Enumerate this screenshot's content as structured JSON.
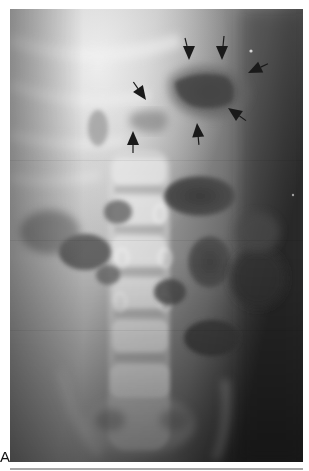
{
  "figure": {
    "panel_label": "A",
    "image_type": "abdominal radiograph (frontal view)",
    "frame": {
      "x": 10,
      "y": 9,
      "width": 293,
      "height": 453
    },
    "background_color": "#ffffff",
    "rule_color": "#a8a8a8",
    "annotations": {
      "arrow_count": 7,
      "arrow_color": "#1a1a1a",
      "arrows": [
        {
          "id": 1,
          "tip_x": 189,
          "tip_y": 60,
          "direction": "down"
        },
        {
          "id": 2,
          "tip_x": 222,
          "tip_y": 60,
          "direction": "down"
        },
        {
          "id": 3,
          "tip_x": 250,
          "tip_y": 73,
          "direction": "down-left"
        },
        {
          "id": 4,
          "tip_x": 146,
          "tip_y": 99,
          "direction": "down-right"
        },
        {
          "id": 5,
          "tip_x": 230,
          "tip_y": 110,
          "direction": "up-left"
        },
        {
          "id": 6,
          "tip_x": 197,
          "tip_y": 125,
          "direction": "up"
        },
        {
          "id": 7,
          "tip_x": 133,
          "tip_y": 132,
          "direction": "up"
        }
      ]
    }
  }
}
